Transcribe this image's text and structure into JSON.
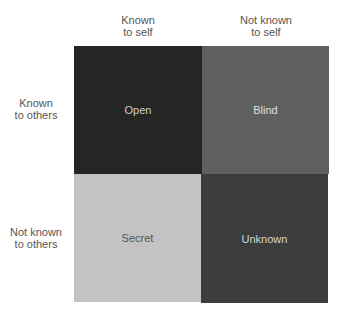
{
  "columns": [
    {
      "line1": "Known",
      "line2": "to self"
    },
    {
      "line1": "Not known",
      "line2": "to self"
    }
  ],
  "rows": [
    {
      "line1": "Known",
      "line2": "to others"
    },
    {
      "line1": "Not known",
      "line2": "to others"
    }
  ],
  "quadrants": [
    {
      "label": "Open",
      "color": "#252525",
      "text_color": "#cfcfcf"
    },
    {
      "label": "Blind",
      "color": "#5f5f5f",
      "text_color": "#e0e0e0"
    },
    {
      "label": "Secret",
      "color": "#c3c3c3",
      "text_color": "#555555"
    },
    {
      "label": "Unknown",
      "color": "#3c3c3c",
      "text_color": "#d5d5d5"
    }
  ]
}
